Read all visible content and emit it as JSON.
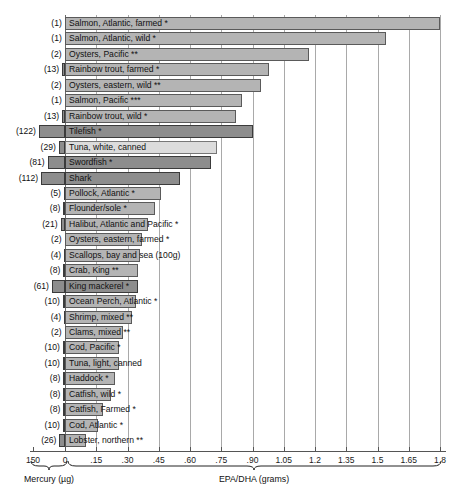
{
  "chart_data": {
    "type": "bar",
    "title": "",
    "orientation": "horizontal",
    "xlabel_left": "Mercury (µg)",
    "xlabel_right": "EPA/DHA (grams)",
    "grid": true,
    "legend": null,
    "axis": {
      "zero_px": 65,
      "epa_ticks": [
        0,
        0.15,
        0.3,
        0.45,
        0.6,
        0.75,
        0.9,
        1.05,
        1.2,
        1.35,
        1.5,
        1.65,
        1.8
      ],
      "epa_tick_labels": [
        "0",
        ".15",
        ".30",
        ".45",
        ".60",
        ".75",
        ".90",
        "1.05",
        "1.2",
        "1.35",
        "1.5",
        "1.65",
        "1.8"
      ],
      "epa_max": 1.8,
      "mercury_ticks": [
        150
      ],
      "mercury_tick_labels": [
        "150"
      ],
      "mercury_max": 150
    },
    "categories": [
      "Salmon, Atlantic, farmed *",
      "Salmon, Atlantic, wild *",
      "Oysters, Pacific **",
      "Rainbow trout, farmed *",
      "Oysters, eastern, wild **",
      "Salmon, Pacific ***",
      "Rainbow trout, wild *",
      "Tilefish *",
      "Tuna, white, canned",
      "Swordfish *",
      "Shark",
      "Pollock, Atlantic *",
      "Flounder/sole *",
      "Halibut, Atlantic and Pacific *",
      "Oysters, eastern, farmed *",
      "Scallops, bay and sea (100g)",
      "Crab, King **",
      "King mackerel *",
      "Ocean Perch, Atlantic *",
      "Shrimp, mixed **",
      "Clams, mixed **",
      "Cod, Pacific *",
      "Tuna, light, canned",
      "Haddock *",
      "Catfish, wild *",
      "Catfish, Farmed *",
      "Cod, Atlantic *",
      "Lobster, northern **"
    ],
    "series": [
      {
        "name": "EPA/DHA (grams)",
        "units": "grams",
        "values": [
          1.8,
          1.54,
          1.17,
          0.98,
          0.94,
          0.85,
          0.82,
          0.9,
          0.73,
          0.7,
          0.55,
          0.46,
          0.43,
          0.4,
          0.37,
          0.36,
          0.35,
          0.35,
          0.34,
          0.32,
          0.28,
          0.26,
          0.26,
          0.24,
          0.22,
          0.18,
          0.16,
          0.1
        ]
      },
      {
        "name": "Mercury (µg)",
        "units": "micrograms",
        "values": [
          1,
          1,
          2,
          13,
          2,
          1,
          13,
          122,
          29,
          81,
          112,
          5,
          8,
          21,
          2,
          4,
          8,
          61,
          10,
          4,
          2,
          10,
          10,
          8,
          8,
          8,
          10,
          26
        ]
      }
    ],
    "rows": [
      {
        "label": "Salmon, Atlantic, farmed *",
        "mercury": 1,
        "mercury_text": "(1)",
        "epa": 1.8,
        "shade": "mid"
      },
      {
        "label": "Salmon, Atlantic, wild *",
        "mercury": 1,
        "mercury_text": "(1)",
        "epa": 1.54,
        "shade": "mid"
      },
      {
        "label": "Oysters, Pacific **",
        "mercury": 2,
        "mercury_text": "(2)",
        "epa": 1.17,
        "shade": "mid"
      },
      {
        "label": "Rainbow trout, farmed *",
        "mercury": 13,
        "mercury_text": "(13)",
        "epa": 0.98,
        "shade": "mid"
      },
      {
        "label": "Oysters, eastern, wild **",
        "mercury": 2,
        "mercury_text": "(2)",
        "epa": 0.94,
        "shade": "mid"
      },
      {
        "label": "Salmon, Pacific ***",
        "mercury": 1,
        "mercury_text": "(1)",
        "epa": 0.85,
        "shade": "mid"
      },
      {
        "label": "Rainbow trout, wild *",
        "mercury": 13,
        "mercury_text": "(13)",
        "epa": 0.82,
        "shade": "mid"
      },
      {
        "label": "Tilefish *",
        "mercury": 122,
        "mercury_text": "(122)",
        "epa": 0.9,
        "shade": "dark"
      },
      {
        "label": "Tuna, white, canned",
        "mercury": 29,
        "mercury_text": "(29)",
        "epa": 0.73,
        "shade": "light"
      },
      {
        "label": "Swordfish *",
        "mercury": 81,
        "mercury_text": "(81)",
        "epa": 0.7,
        "shade": "dark"
      },
      {
        "label": "Shark",
        "mercury": 112,
        "mercury_text": "(112)",
        "epa": 0.55,
        "shade": "dark"
      },
      {
        "label": "Pollock, Atlantic *",
        "mercury": 5,
        "mercury_text": "(5)",
        "epa": 0.46,
        "shade": "mid"
      },
      {
        "label": "Flounder/sole *",
        "mercury": 8,
        "mercury_text": "(8)",
        "epa": 0.43,
        "shade": "mid"
      },
      {
        "label": "Halibut, Atlantic and Pacific *",
        "mercury": 21,
        "mercury_text": "(21)",
        "epa": 0.4,
        "shade": "mid"
      },
      {
        "label": "Oysters, eastern, farmed *",
        "mercury": 2,
        "mercury_text": "(2)",
        "epa": 0.37,
        "shade": "mid"
      },
      {
        "label": "Scallops, bay and sea (100g)",
        "mercury": 4,
        "mercury_text": "(4)",
        "epa": 0.36,
        "shade": "mid"
      },
      {
        "label": "Crab, King **",
        "mercury": 8,
        "mercury_text": "(8)",
        "epa": 0.35,
        "shade": "mid"
      },
      {
        "label": "King mackerel *",
        "mercury": 61,
        "mercury_text": "(61)",
        "epa": 0.35,
        "shade": "dark"
      },
      {
        "label": "Ocean Perch, Atlantic *",
        "mercury": 10,
        "mercury_text": "(10)",
        "epa": 0.34,
        "shade": "mid"
      },
      {
        "label": "Shrimp, mixed **",
        "mercury": 4,
        "mercury_text": "(4)",
        "epa": 0.32,
        "shade": "mid"
      },
      {
        "label": "Clams, mixed **",
        "mercury": 2,
        "mercury_text": "(2)",
        "epa": 0.28,
        "shade": "mid"
      },
      {
        "label": "Cod, Pacific *",
        "mercury": 10,
        "mercury_text": "(10)",
        "epa": 0.26,
        "shade": "mid"
      },
      {
        "label": "Tuna, light, canned",
        "mercury": 10,
        "mercury_text": "(10)",
        "epa": 0.26,
        "shade": "mid"
      },
      {
        "label": "Haddock *",
        "mercury": 8,
        "mercury_text": "(8)",
        "epa": 0.24,
        "shade": "mid"
      },
      {
        "label": "Catfish, wild *",
        "mercury": 8,
        "mercury_text": "(8)",
        "epa": 0.22,
        "shade": "mid"
      },
      {
        "label": "Catfish, Farmed *",
        "mercury": 8,
        "mercury_text": "(8)",
        "epa": 0.18,
        "shade": "mid"
      },
      {
        "label": "Cod, Atlantic *",
        "mercury": 10,
        "mercury_text": "(10)",
        "epa": 0.16,
        "shade": "mid"
      },
      {
        "label": "Lobster, northern **",
        "mercury": 26,
        "mercury_text": "(26)",
        "epa": 0.1,
        "shade": "mid"
      }
    ],
    "colors": {
      "bar_mid": "#b4b4b4",
      "bar_dark": "#8d8d8d",
      "bar_light": "#dcdcdc",
      "mercury_bar": "#8d8d8d",
      "grid": "#a9a9a9",
      "axis": "#555555",
      "text": "#111111",
      "background": "#ffffff"
    }
  }
}
